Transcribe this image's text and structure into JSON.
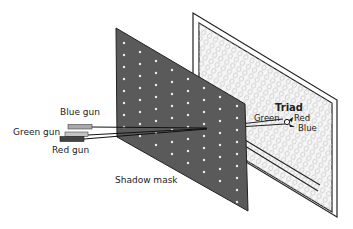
{
  "diagram": {
    "labels": {
      "blue_gun": "Blue gun",
      "green_gun": "Green gun",
      "red_gun": "Red gun",
      "shadow_mask": "Shadow mask",
      "triad": "Triad",
      "triad_green": "Green",
      "triad_red": "Red",
      "triad_blue": "Blue"
    },
    "colors": {
      "mask": "#5a5a5a",
      "mask_hole": "#f0f0f0",
      "screen_bg": "#f4f4f4",
      "phosphor_dot": "#cfcfcf",
      "blue_gun": "#a9a9a9",
      "green_gun": "#c4c4c4",
      "red_gun": "#444444",
      "outline": "#222222"
    }
  }
}
